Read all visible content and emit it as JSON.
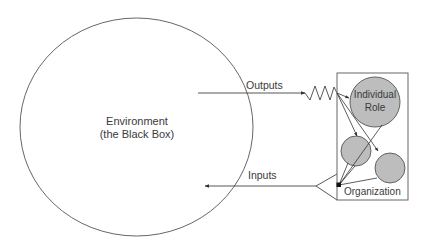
{
  "diagram": {
    "environment": {
      "line1": "Environment",
      "line2": "(the Black Box)"
    },
    "arrows": {
      "outputs_label": "Outputs",
      "inputs_label": "Inputs"
    },
    "organization": {
      "label": "Organization",
      "individual_role_line1": "Individual",
      "individual_role_line2": "Role"
    },
    "colors": {
      "stroke": "#555555",
      "role_fill": "#bdbdbd",
      "text": "#3a3a3a"
    }
  }
}
